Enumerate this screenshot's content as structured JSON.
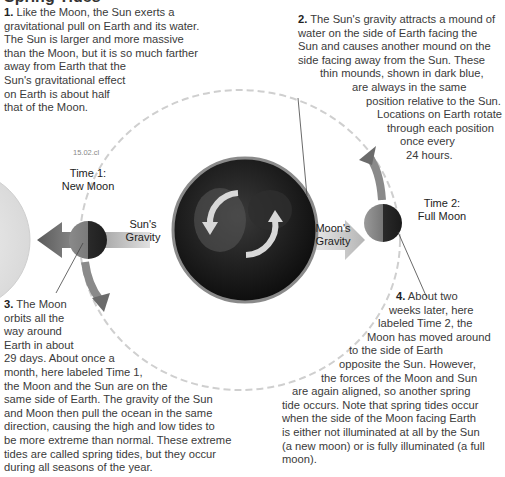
{
  "title": "Spring Tides",
  "figure_id": "15.02.cl",
  "captions": {
    "c1": {
      "number": "1.",
      "lines": [
        "Like the Moon, the Sun exerts a",
        "gravitational pull on Earth and its water.",
        "The Sun is larger and more massive",
        "than the Moon, but it is so much farther",
        "away from Earth that the",
        "Sun's gravitational effect",
        "on Earth is about half",
        "that of the Moon."
      ]
    },
    "c2": {
      "number": "2.",
      "lines": [
        "The Sun's gravity attracts a mound of",
        "water on the side of Earth facing the",
        "Sun and causes another mound on the",
        "side facing away from the Sun. These",
        "thin mounds, shown in dark blue,",
        "are always in the same",
        "position relative to the Sun.",
        "Locations on Earth rotate",
        "through each position",
        "once every",
        "24 hours."
      ]
    },
    "c3": {
      "number": "3.",
      "lines": [
        "The Moon",
        "orbits all the",
        "way around",
        "Earth in about",
        "29 days. About once a",
        "month, here labeled Time 1,",
        "the Moon and the Sun are on the",
        "same side of Earth. The gravity of the Sun",
        "and Moon then pull the ocean in the same",
        "direction, causing the high and low tides to",
        "be more extreme than normal. These extreme",
        "tides are called spring tides, but they occur",
        "during all seasons of the year."
      ]
    },
    "c4": {
      "number": "4.",
      "lines": [
        "About two",
        "weeks later, here",
        "labeled Time 2, the",
        "Moon has moved around",
        "to the side of Earth",
        "opposite the Sun. However,",
        "the forces of the Moon and Sun",
        "are again aligned, so another spring",
        "tide occurs. Note that spring tides occur",
        "when the side of the Moon facing Earth",
        "is either not illuminated at all by the Sun",
        "(a new moon) or is fully illuminated (a full",
        "moon)."
      ]
    }
  },
  "labels": {
    "time1_a": "Time 1:",
    "time1_b": "New Moon",
    "time2_a": "Time 2:",
    "time2_b": "Full Moon",
    "sun_gravity_a": "Sun's",
    "sun_gravity_b": "Gravity",
    "moon_gravity_a": "Moon's",
    "moon_gravity_b": "Gravity"
  },
  "colors": {
    "sun": "#e6e6e6",
    "earth": "#1c1c1c",
    "moon": "#555555",
    "arrow": "#6b6b6b",
    "orbit": "#c8c8c8"
  }
}
